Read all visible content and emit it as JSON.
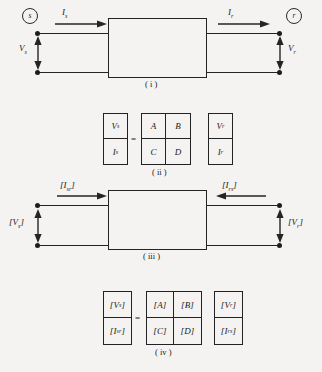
{
  "figure": {
    "background_color": "#f4f3f1",
    "ink_color": "#242424"
  },
  "diagram_i": {
    "caption": "( i )",
    "source_node": "s",
    "receiving_node": "r",
    "sending_current": "I",
    "sending_current_sub": "s",
    "sending_voltage": "V",
    "sending_voltage_sub": "s",
    "receiving_current": "I",
    "receiving_current_sub": "r",
    "receiving_voltage": "V",
    "receiving_voltage_sub": "r",
    "current_arrow_direction_left": "right",
    "current_arrow_direction_right": "right"
  },
  "matrix_ii": {
    "caption": "( ii )",
    "equals_sign": "=",
    "left_vector": [
      {
        "sym": "V",
        "sub": "s"
      },
      {
        "sym": "I",
        "sub": "s"
      }
    ],
    "abcd_matrix": [
      {
        "sym": "A",
        "sub": ""
      },
      {
        "sym": "B",
        "sub": ""
      },
      {
        "sym": "C",
        "sub": ""
      },
      {
        "sym": "D",
        "sub": ""
      }
    ],
    "right_vector": [
      {
        "sym": "V",
        "sub": "r"
      },
      {
        "sym": "I",
        "sub": "r"
      }
    ]
  },
  "diagram_iii": {
    "caption": "( iii )",
    "sending_current": "[I",
    "sending_current_sub": "sr",
    "sending_current_close": "]",
    "sending_voltage": "[V",
    "sending_voltage_sub": "s",
    "sending_voltage_close": "]",
    "receiving_current": "[I",
    "receiving_current_sub": "rs",
    "receiving_current_close": "]",
    "receiving_voltage": "[V",
    "receiving_voltage_sub": "r",
    "receiving_voltage_close": "]",
    "current_arrow_direction_left": "right",
    "current_arrow_direction_right": "left"
  },
  "matrix_iv": {
    "caption": "( iv )",
    "equals_sign": "=",
    "left_vector": [
      {
        "open": "[",
        "sym": "V",
        "sub": "s",
        "close": "]"
      },
      {
        "open": "[",
        "sym": "I",
        "sub": "sr",
        "close": "]"
      }
    ],
    "abcd_matrix": [
      {
        "open": "[",
        "sym": "A",
        "sub": "",
        "close": "]"
      },
      {
        "open": "[",
        "sym": "B",
        "sub": "",
        "close": "]"
      },
      {
        "open": "[",
        "sym": "C",
        "sub": "",
        "close": "]"
      },
      {
        "open": "[",
        "sym": "D",
        "sub": "",
        "close": "]"
      }
    ],
    "right_vector": [
      {
        "open": "[",
        "sym": "V",
        "sub": "r",
        "close": "]"
      },
      {
        "open": "[",
        "sym": "I",
        "sub": "rs",
        "close": "]"
      }
    ]
  }
}
